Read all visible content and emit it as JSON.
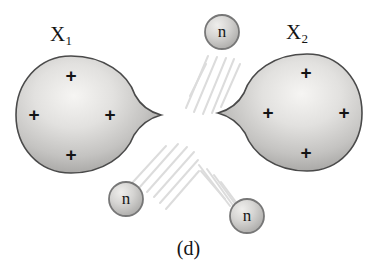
{
  "figure": {
    "caption": "(d)",
    "background_color": "#ffffff",
    "fragments": [
      {
        "id": "x1",
        "label_text": "X",
        "label_subscript": "1",
        "charge_symbol": "+",
        "charge_count": 4,
        "charge_labels": [
          "+",
          "+",
          "+",
          "+"
        ],
        "fill_light": "#f2f1ef",
        "fill_dark": "#9b9a98",
        "stroke_color": "#4a4a4a"
      },
      {
        "id": "x2",
        "label_text": "X",
        "label_subscript": "2",
        "charge_symbol": "+",
        "charge_count": 4,
        "charge_labels": [
          "+",
          "+",
          "+",
          "+"
        ],
        "fill_light": "#f2f1ef",
        "fill_dark": "#9b9a98",
        "stroke_color": "#4a4a4a"
      }
    ],
    "neutrons": [
      {
        "id": "neutron-top",
        "label": "n",
        "cx": 222,
        "cy": 32,
        "r": 17
      },
      {
        "id": "neutron-bottom-left",
        "label": "n",
        "cx": 126,
        "cy": 199,
        "r": 17
      },
      {
        "id": "neutron-bottom-right",
        "label": "n",
        "cx": 247,
        "cy": 216,
        "r": 17
      }
    ],
    "trail_color": "#dcdcdc",
    "trail_groups": 3,
    "colors": {
      "text": "#141414",
      "fragment_outline": "#4a4a4a",
      "neutron_outline": "#777777",
      "trail": "#dcdcdc"
    }
  }
}
